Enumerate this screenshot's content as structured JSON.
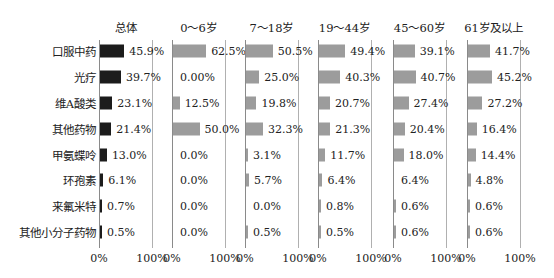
{
  "chart_data": {
    "type": "bar",
    "orientation": "horizontal",
    "layout": "small-multiples",
    "categories": [
      "口服中药",
      "光疗",
      "维A酸类",
      "其他药物",
      "甲氨蝶呤",
      "环孢素",
      "来氟米特",
      "其他小分子药物"
    ],
    "xlim": [
      0,
      100
    ],
    "x_ticks": [
      "0%",
      "100%"
    ],
    "grid": false,
    "legend": null,
    "panels": [
      {
        "title": "总体",
        "color": "#1c1c1c",
        "values": [
          45.9,
          39.7,
          23.1,
          21.4,
          13.0,
          6.1,
          0.7,
          0.5
        ],
        "labels": [
          "45.9%",
          "39.7%",
          "23.1%",
          "21.4%",
          "13.0%",
          "6.1%",
          "0.7%",
          "0.5%"
        ]
      },
      {
        "title": "0～6岁",
        "color": "#9c9c9c",
        "values": [
          62.5,
          0.0,
          12.5,
          50.0,
          0.0,
          0.0,
          0.0,
          0.0
        ],
        "labels": [
          "62.5%",
          "0.00%",
          "12.5%",
          "50.0%",
          "0.0%",
          "0.0%",
          "0.0%",
          "0.0%"
        ]
      },
      {
        "title": "7～18岁",
        "color": "#9c9c9c",
        "values": [
          50.5,
          25.0,
          19.8,
          32.3,
          3.1,
          5.7,
          0.0,
          0.5
        ],
        "labels": [
          "50.5%",
          "25.0%",
          "19.8%",
          "32.3%",
          "3.1%",
          "5.7%",
          "0.0%",
          "0.5%"
        ]
      },
      {
        "title": "19～44岁",
        "color": "#9c9c9c",
        "values": [
          49.4,
          40.3,
          20.7,
          21.3,
          11.7,
          6.4,
          0.8,
          0.5
        ],
        "labels": [
          "49.4%",
          "40.3%",
          "20.7%",
          "21.3%",
          "11.7%",
          "6.4%",
          "0.8%",
          "0.5%"
        ]
      },
      {
        "title": "45～60岁",
        "color": "#9c9c9c",
        "values": [
          39.1,
          40.7,
          27.4,
          20.4,
          18.0,
          0.0,
          0.6,
          0.6
        ],
        "labels": [
          "39.1%",
          "40.7%",
          "27.4%",
          "20.4%",
          "18.0%",
          "6.4%",
          "0.6%",
          "0.6%"
        ]
      },
      {
        "title": "61岁及以上",
        "color": "#9c9c9c",
        "values": [
          41.7,
          45.2,
          27.2,
          16.4,
          14.4,
          4.8,
          0.6,
          0.6
        ],
        "labels": [
          "41.7%",
          "45.2%",
          "27.2%",
          "16.4%",
          "14.4%",
          "4.8%",
          "0.6%",
          "0.6%"
        ]
      }
    ],
    "title": "",
    "xlabel": "",
    "ylabel": ""
  }
}
